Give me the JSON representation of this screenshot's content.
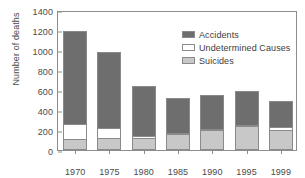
{
  "chart_data": {
    "type": "bar",
    "subtype": "stacked",
    "title": "",
    "xlabel": "",
    "ylabel": "Number of deaths",
    "categories": [
      "1970",
      "1975",
      "1980",
      "1985",
      "1990",
      "1995",
      "1999"
    ],
    "ylim": [
      0,
      1400
    ],
    "yticks": [
      0,
      200,
      400,
      600,
      800,
      1000,
      1200,
      1400
    ],
    "ytick_labels": [
      "0",
      "200",
      "400",
      "600",
      "800",
      "1000",
      "1200",
      "1400"
    ],
    "grid": false,
    "legend_position": "upper right",
    "series": [
      {
        "name": "Suicides",
        "color": "#c8c8c8",
        "values": [
          110,
          120,
          120,
          160,
          205,
          245,
          205
        ]
      },
      {
        "name": "Undetermined Causes",
        "color": "#ffffff",
        "values": [
          155,
          105,
          20,
          10,
          5,
          5,
          30
        ]
      },
      {
        "name": "Accidents",
        "color": "#6e6e6e",
        "values": [
          925,
          755,
          500,
          355,
          340,
          340,
          255
        ]
      }
    ],
    "totals": [
      1190,
      980,
      640,
      525,
      550,
      590,
      490
    ]
  },
  "legend": {
    "entries": [
      {
        "label": "Accidents",
        "color": "#6e6e6e"
      },
      {
        "label": "Undetermined Causes",
        "color": "#ffffff"
      },
      {
        "label": "Suicides",
        "color": "#c8c8c8"
      }
    ]
  }
}
